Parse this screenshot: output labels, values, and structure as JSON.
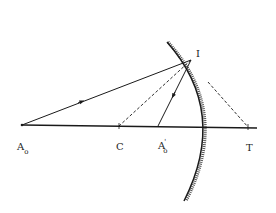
{
  "diagram": {
    "type": "concave-mirror-ray-diagram",
    "labels": {
      "object_point": {
        "main": "A",
        "sub": "o"
      },
      "center": "C",
      "image_point": {
        "main": "A",
        "sup": "'",
        "sub": "o"
      },
      "focus_tangent": "T",
      "incidence_point": "I"
    },
    "points": {
      "A0": [
        22,
        125
      ],
      "C": [
        119,
        126
      ],
      "A0_prime": [
        158,
        126
      ],
      "I": [
        191,
        60
      ],
      "T": [
        248,
        127
      ]
    },
    "colors": {
      "line": "#1a1a1a",
      "background": "#ffffff"
    }
  }
}
